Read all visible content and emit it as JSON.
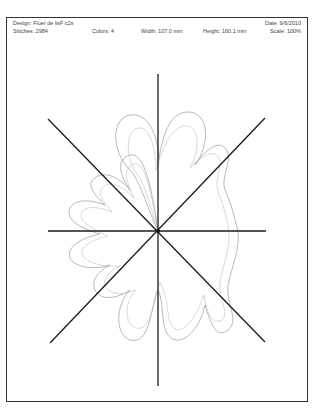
{
  "header": {
    "design_label": "Design:",
    "design_value": "Fluer de lisF c2s",
    "design": "Design: Fluer de lisF c2s",
    "stitches": "Stitches: 2984",
    "colors": "Colors: 4",
    "width": "Width: 107.0 mm",
    "height": "Height: 160.1 mm",
    "date": "Date: 9/6/2010",
    "scale": "Scale: 100%"
  },
  "drawing": {
    "center": [
      158,
      231
    ],
    "axis_color": "#1a1a1a",
    "outline_color": "#9a9a9a",
    "inner_outline_color": "#bdbdbd",
    "axes": {
      "vertical": [
        [
          158,
          74
        ],
        [
          158,
          386
        ]
      ],
      "horizontal": [
        [
          48,
          231
        ],
        [
          266,
          231
        ]
      ],
      "diag_tl_br": [
        [
          48,
          119
        ],
        [
          265,
          342
        ]
      ],
      "diag_bl_tr": [
        [
          50,
          343
        ],
        [
          265,
          118
        ]
      ]
    }
  }
}
